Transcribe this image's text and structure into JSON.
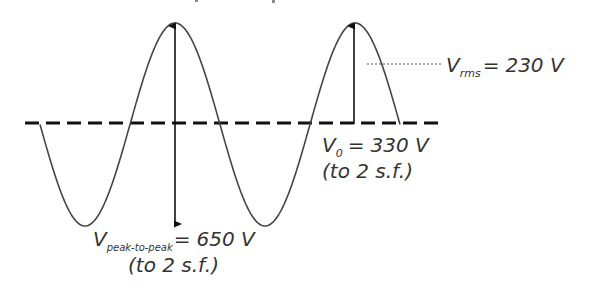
{
  "diagram": {
    "colors": {
      "wave": "#444444",
      "axis": "#111111",
      "arrow": "#111111",
      "rms_line": "#555555",
      "text": "#333333",
      "background": "#ffffff"
    },
    "labels": {
      "rms": {
        "symbol": "V",
        "subscript": "rms",
        "equals": "=",
        "value": "230 V"
      },
      "peak": {
        "symbol": "V",
        "subscript": "0",
        "equals": "=",
        "value": "330 V",
        "note": "(to 2 s.f.)"
      },
      "peak_to_peak": {
        "symbol": "V",
        "subscript": "peak-to-peak",
        "equals": "=",
        "value": "650 V",
        "note": "(to 2 s.f.)"
      }
    },
    "waveform": {
      "type": "sine",
      "cycles_shown": 2,
      "annotations": [
        "peak arrow",
        "peak-to-peak arrow",
        "rms level line",
        "dashed zero axis"
      ]
    }
  }
}
